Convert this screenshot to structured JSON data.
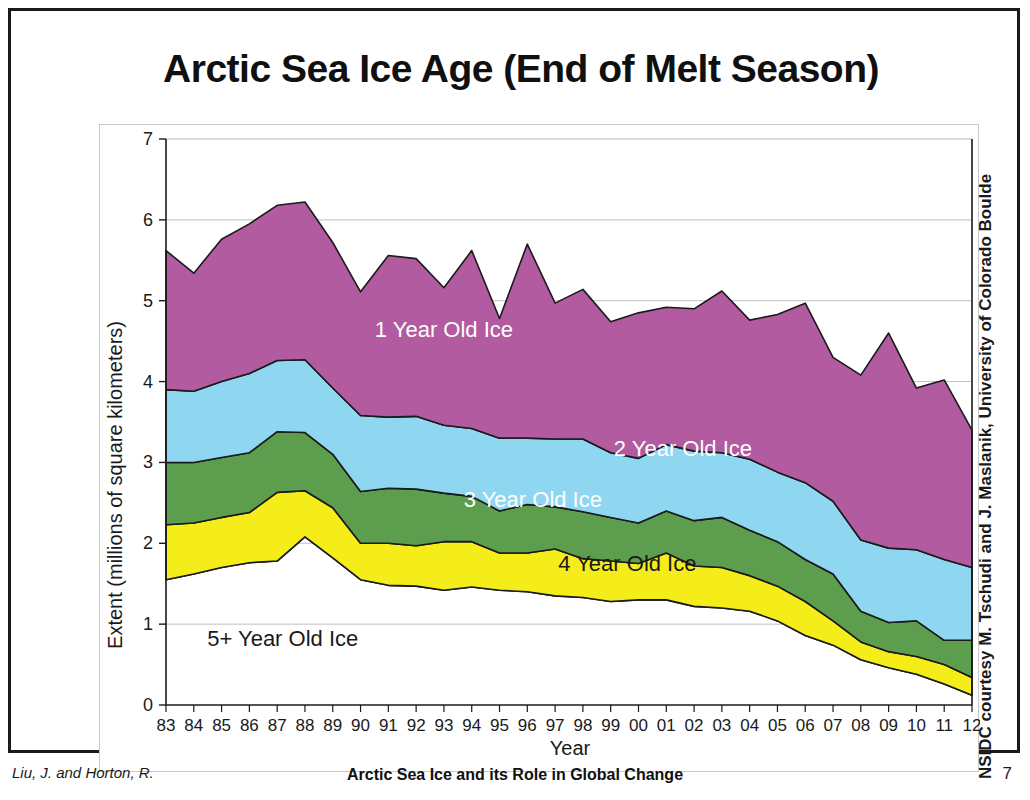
{
  "slide": {
    "title": "Arctic Sea Ice Age (End of Melt Season)",
    "credit": "NSIDC courtesy M. Tschudi and J. Maslanik, University of Colorado Boulde",
    "page_number": "7"
  },
  "footer": {
    "author": "Liu, J. and Horton, R.",
    "center_title": "Arctic Sea Ice and its Role in Global Change"
  },
  "chart_data": {
    "type": "area",
    "title": "Arctic Sea Ice Age (End of Melt Season)",
    "xlabel": "Year",
    "ylabel": "Extent (millions of square kilometers)",
    "xlim": [
      0,
      29
    ],
    "ylim": [
      0,
      7
    ],
    "yticks": [
      0,
      1,
      2,
      3,
      4,
      5,
      6,
      7
    ],
    "grid": "horizontal-light",
    "legend": "inline-labels",
    "stacked": true,
    "stack_order_bottom_to_top": [
      "5+ Year Old Ice",
      "4 Year Old Ice",
      "3 Year Old Ice",
      "2 Year Old Ice",
      "1 Year Old Ice"
    ],
    "categories": [
      "83",
      "84",
      "85",
      "86",
      "87",
      "88",
      "89",
      "90",
      "91",
      "92",
      "93",
      "94",
      "95",
      "96",
      "97",
      "98",
      "99",
      "00",
      "01",
      "02",
      "03",
      "04",
      "05",
      "06",
      "07",
      "08",
      "09",
      "10",
      "11",
      "12"
    ],
    "series": [
      {
        "name": "5+ Year Old Ice",
        "color": "#ffffff",
        "label_color": "#1a1a1a",
        "values": [
          1.55,
          1.62,
          1.7,
          1.76,
          1.78,
          2.08,
          1.82,
          1.55,
          1.48,
          1.47,
          1.42,
          1.46,
          1.42,
          1.4,
          1.35,
          1.33,
          1.28,
          1.3,
          1.3,
          1.22,
          1.2,
          1.16,
          1.04,
          0.86,
          0.74,
          0.56,
          0.46,
          0.38,
          0.26,
          0.12
        ]
      },
      {
        "name": "4 Year Old Ice",
        "color": "#f5ed1a",
        "label_color": "#1a1a1a",
        "values": [
          0.68,
          0.63,
          0.62,
          0.62,
          0.85,
          0.57,
          0.62,
          0.45,
          0.52,
          0.5,
          0.6,
          0.56,
          0.46,
          0.48,
          0.58,
          0.48,
          0.5,
          0.45,
          0.58,
          0.5,
          0.5,
          0.44,
          0.43,
          0.42,
          0.3,
          0.22,
          0.2,
          0.22,
          0.24,
          0.22
        ]
      },
      {
        "name": "3 Year Old Ice",
        "color": "#5d9e4e",
        "label_color": "#ffffff",
        "values": [
          0.77,
          0.75,
          0.74,
          0.74,
          0.75,
          0.72,
          0.66,
          0.64,
          0.68,
          0.7,
          0.6,
          0.56,
          0.52,
          0.6,
          0.52,
          0.58,
          0.54,
          0.5,
          0.52,
          0.56,
          0.62,
          0.56,
          0.55,
          0.52,
          0.58,
          0.38,
          0.36,
          0.44,
          0.3,
          0.46
        ]
      },
      {
        "name": "2 Year Old Ice",
        "color": "#8fd6f0",
        "label_color": "#ffffff",
        "values": [
          0.9,
          0.88,
          0.94,
          0.98,
          0.88,
          0.9,
          0.82,
          0.94,
          0.88,
          0.9,
          0.84,
          0.84,
          0.9,
          0.82,
          0.84,
          0.9,
          0.8,
          0.8,
          0.82,
          0.86,
          0.8,
          0.88,
          0.86,
          0.95,
          0.9,
          0.88,
          0.92,
          0.88,
          1.0,
          0.9
        ]
      },
      {
        "name": "1 Year Old Ice",
        "color": "#b25ba0",
        "label_color": "#ffffff",
        "values": [
          1.72,
          1.46,
          1.76,
          1.85,
          1.92,
          1.95,
          1.8,
          1.53,
          2.0,
          1.95,
          1.7,
          2.2,
          1.48,
          2.4,
          1.68,
          1.85,
          1.62,
          1.8,
          1.7,
          1.76,
          2.0,
          1.72,
          1.95,
          2.22,
          1.78,
          2.04,
          2.66,
          2.0,
          2.22,
          1.7
        ]
      }
    ],
    "totals": [
      5.62,
      5.34,
      5.76,
      5.95,
      6.18,
      6.22,
      5.72,
      5.11,
      5.56,
      5.52,
      5.16,
      5.62,
      4.78,
      5.7,
      4.97,
      5.14,
      4.74,
      4.85,
      4.92,
      4.9,
      5.12,
      4.76,
      4.83,
      4.97,
      4.3,
      4.08,
      4.6,
      3.92,
      4.02,
      3.4
    ],
    "inline_labels": [
      {
        "text": "1 Year Old Ice",
        "color": "#ffffff"
      },
      {
        "text": "2 Year Old Ice",
        "color": "#ffffff"
      },
      {
        "text": "3 Year Old Ice",
        "color": "#ffffff"
      },
      {
        "text": "4 Year Old Ice",
        "color": "#1a1a1a"
      },
      {
        "text": "5+ Year Old Ice",
        "color": "#1a1a1a"
      }
    ]
  }
}
